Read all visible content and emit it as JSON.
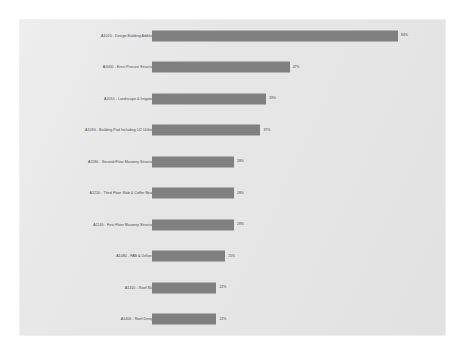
{
  "chart_data": {
    "type": "bar",
    "orientation": "horizontal",
    "title": "",
    "subtitle": "",
    "xlabel": "",
    "ylabel": "",
    "xlim": [
      0,
      100
    ],
    "grid": false,
    "legend": null,
    "bar_color": "#808080",
    "panel_color": "#e7e7e7",
    "figure_color": "#ffffff",
    "categories": [
      "A1020 - Design Building Addition",
      "A2000 - Erect Precast Structure",
      "A2010 - Landscape & Irrigation",
      "A1030 - Building Pad Including 1/2 Utilities",
      "A1180 - Second Floor Masonry Structure",
      "A1210 - Third Floor Slab & Coffer Beam",
      "A1140 - First Floor Masonry Structure",
      "A1080 - FAB & Delivery",
      "A1310 - Roof Slab",
      "A1400 - Roof Design"
    ],
    "values": [
      84,
      47,
      39,
      37,
      28,
      28,
      28,
      25,
      22,
      22
    ],
    "value_labels": [
      "84%",
      "47%",
      "39%",
      "37%",
      "28%",
      "28%",
      "28%",
      "25%",
      "22%",
      "22%"
    ],
    "bars": [
      {
        "label": "A1020 - Design Building Addition",
        "value": 84,
        "value_label": "84%"
      },
      {
        "label": "A2000 - Erect Precast Structure",
        "value": 47,
        "value_label": "47%"
      },
      {
        "label": "A2010 - Landscape & Irrigation",
        "value": 39,
        "value_label": "39%"
      },
      {
        "label": "A1030 - Building Pad Including 1/2 Utilities",
        "value": 37,
        "value_label": "37%"
      },
      {
        "label": "A1180 - Second Floor Masonry Structure",
        "value": 28,
        "value_label": "28%"
      },
      {
        "label": "A1210 - Third Floor Slab & Coffer Beam",
        "value": 28,
        "value_label": "28%"
      },
      {
        "label": "A1140 - First Floor Masonry Structure",
        "value": 28,
        "value_label": "28%"
      },
      {
        "label": "A1080 - FAB & Delivery",
        "value": 25,
        "value_label": "25%"
      },
      {
        "label": "A1310 - Roof Slab",
        "value": 22,
        "value_label": "22%"
      },
      {
        "label": "A1400 - Roof Design",
        "value": 22,
        "value_label": "22%"
      }
    ]
  }
}
